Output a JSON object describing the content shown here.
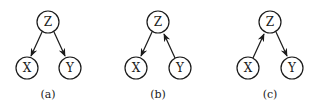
{
  "diagram": {
    "panels": [
      {
        "caption": "(a)",
        "nodes": {
          "Z": "Z",
          "X": "X",
          "Y": "Y"
        },
        "edges": [
          [
            "Z",
            "X"
          ],
          [
            "Z",
            "Y"
          ]
        ]
      },
      {
        "caption": "(b)",
        "nodes": {
          "Z": "Z",
          "X": "X",
          "Y": "Y"
        },
        "edges": [
          [
            "Z",
            "X"
          ],
          [
            "Y",
            "Z"
          ]
        ]
      },
      {
        "caption": "(c)",
        "nodes": {
          "Z": "Z",
          "X": "X",
          "Y": "Y"
        },
        "edges": [
          [
            "X",
            "Z"
          ],
          [
            "Z",
            "Y"
          ]
        ]
      }
    ]
  }
}
